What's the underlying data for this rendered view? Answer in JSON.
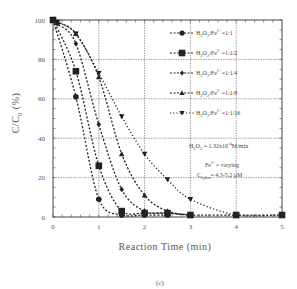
{
  "chart_data": {
    "type": "scatter",
    "title": "",
    "xlabel": "Reaction Time (min)",
    "ylabel": "C/C0 (%)",
    "ylabel_main": "C/C",
    "ylabel_sub": "0",
    "ylabel_unit": "(%)",
    "xlim": [
      0,
      5
    ],
    "ylim": [
      0,
      100
    ],
    "xticks": [
      0,
      1,
      2,
      3,
      4,
      5
    ],
    "yticks": [
      0,
      20,
      40,
      60,
      80,
      100
    ],
    "grid": true,
    "legend_position": "upper right",
    "caption": "(c)",
    "series": [
      {
        "name": "H2O2:Fe2+=1:1",
        "label_ratio": "=1:1",
        "marker": "circle",
        "x": [
          0,
          0.5,
          1,
          1.5,
          2,
          2.5
        ],
        "values": [
          100,
          61,
          9,
          1,
          1,
          1
        ]
      },
      {
        "name": "H2O2:Fe2+=1:1/2",
        "label_ratio": "=1:1/2",
        "marker": "square",
        "x": [
          0,
          0.5,
          1,
          1.5,
          2,
          2.5,
          3,
          4,
          5
        ],
        "values": [
          100,
          74,
          26,
          3,
          2,
          2,
          1,
          1,
          1
        ]
      },
      {
        "name": "H2O2:Fe2+=1:1/4",
        "label_ratio": "=1:1/4",
        "marker": "diamond",
        "x": [
          0,
          0.1,
          0.5,
          1,
          1.5,
          2,
          2.5,
          3
        ],
        "values": [
          100,
          98,
          88,
          47,
          14,
          3,
          2,
          1
        ]
      },
      {
        "name": "H2O2:Fe2+=1:1/8",
        "label_ratio": "=1:1/8",
        "marker": "triangle-up",
        "x": [
          0,
          0.1,
          0.5,
          1,
          1.5,
          2,
          2.5,
          3
        ],
        "values": [
          100,
          99,
          93,
          71,
          32,
          11,
          3,
          1
        ]
      },
      {
        "name": "H2O2:Fe2+=1:1/16",
        "label_ratio": "=1:1/16",
        "marker": "triangle-down",
        "x": [
          0,
          0.1,
          0.5,
          1,
          1.5,
          2,
          2.5,
          3,
          4,
          5
        ],
        "values": [
          100,
          99,
          93,
          73,
          51,
          32,
          19,
          9,
          1,
          1
        ]
      }
    ],
    "annotations": [
      {
        "text": "H2O2 = 1.32x10^-4 M/min",
        "main": "H",
        "sub1": "2",
        "mid": "O",
        "sub2": "2",
        "rest": " = 1.32x10",
        "sup": "-4",
        "tail": "M/min"
      },
      {
        "text": "Fe2+ = varying",
        "main": "Fe",
        "sup": "2+",
        "tail": "= varying"
      },
      {
        "text": "C0,phen = 4.3-5.2 μM",
        "main": "C",
        "sub": "0,phen",
        "tail": "= 4.3-5.2 μM"
      }
    ]
  },
  "colors": {
    "axis": "#444444",
    "grid": "#666666",
    "series": "#222222",
    "text": "#555555"
  }
}
